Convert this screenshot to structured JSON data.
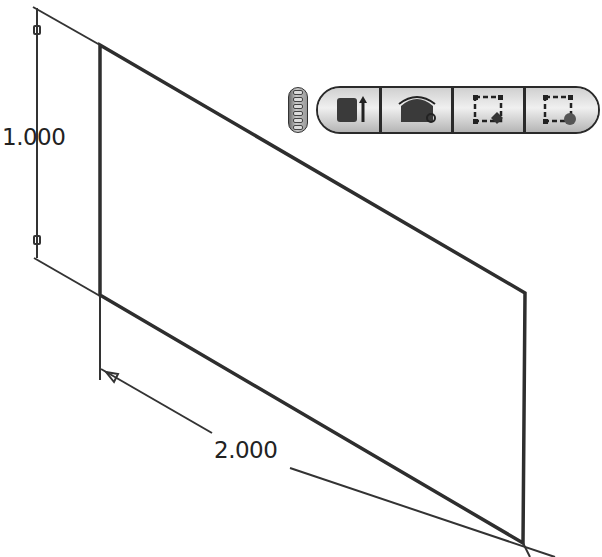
{
  "drawing": {
    "shape": "parallelogram-plane",
    "vertices": [
      [
        100,
        45
      ],
      [
        525,
        293
      ],
      [
        523,
        543
      ],
      [
        100,
        295
      ]
    ],
    "stroke_color": "#2e2e2e"
  },
  "dimensions": {
    "height": {
      "value": "1.000"
    },
    "width": {
      "value": "2.000"
    }
  },
  "toolbar": {
    "grip": {
      "icon": "grip-handle-icon"
    },
    "buttons": [
      {
        "name": "extrude",
        "icon": "extrude-icon"
      },
      {
        "name": "revolve",
        "icon": "revolve-icon"
      },
      {
        "name": "sketch-edit",
        "icon": "sketch-edit-icon"
      },
      {
        "name": "sketch-point",
        "icon": "sketch-point-icon"
      }
    ]
  }
}
